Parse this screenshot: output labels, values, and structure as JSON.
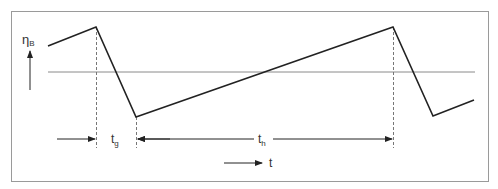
{
  "diagram": {
    "y_label": "η",
    "y_label_sub": "B",
    "x_label": "t",
    "tg_label": "t",
    "tg_sub": "g",
    "th_label": "t",
    "th_sub": "h",
    "colors": {
      "frame": "#9a9a9a",
      "curve": "#222222",
      "reference_line": "#8a8a8a",
      "dashed": "#777777",
      "arrow": "#222222"
    },
    "waveform_points": [
      [
        48,
        46
      ],
      [
        96,
        27
      ],
      [
        136,
        117
      ],
      [
        393,
        27
      ],
      [
        433,
        116
      ],
      [
        474,
        100
      ]
    ],
    "reference_line_y": 72
  }
}
